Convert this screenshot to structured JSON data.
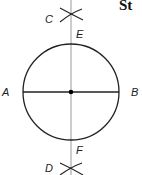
{
  "header": {
    "partial_text": "St"
  },
  "diagram": {
    "type": "geometric-construction-perpendicular-bisector",
    "circle": {
      "cx": 71,
      "cy": 92,
      "r": 48,
      "stroke": "#222222"
    },
    "diameter": {
      "from": "A",
      "to": "B"
    },
    "bisector_line": {
      "color": "#999999"
    },
    "center_point": {
      "color": "#000000"
    },
    "labels": {
      "A": "A",
      "B": "B",
      "C": "C",
      "D": "D",
      "E": "E",
      "F": "F"
    }
  }
}
